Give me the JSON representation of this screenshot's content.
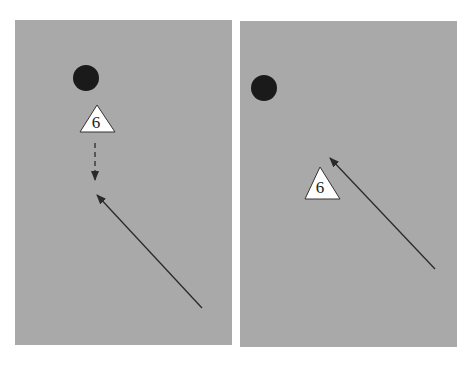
{
  "figure": {
    "panels": [
      {
        "id": "left",
        "background": "#a9a9a9",
        "ball": {
          "cx": 86,
          "cy": 78,
          "r": 13,
          "color": "#1a1a1a"
        },
        "player": {
          "label": "6",
          "points": "97,105 80,132 115,132",
          "text_x": 96,
          "text_y": 128
        },
        "dashed_arrow": {
          "x1": 95,
          "y1": 143,
          "x2": 95,
          "y2": 180,
          "style": "dashed"
        },
        "solid_arrow": {
          "x1": 202,
          "y1": 308,
          "x2": 97,
          "y2": 195,
          "style": "solid"
        }
      },
      {
        "id": "right",
        "background": "#a9a9a9",
        "ball": {
          "cx": 264,
          "cy": 88,
          "r": 13,
          "color": "#1a1a1a"
        },
        "player": {
          "label": "6",
          "points": "320,167 305,199 340,199",
          "text_x": 320,
          "text_y": 193
        },
        "solid_arrow": {
          "x1": 435,
          "y1": 269,
          "x2": 330,
          "y2": 158,
          "style": "solid"
        }
      }
    ]
  }
}
